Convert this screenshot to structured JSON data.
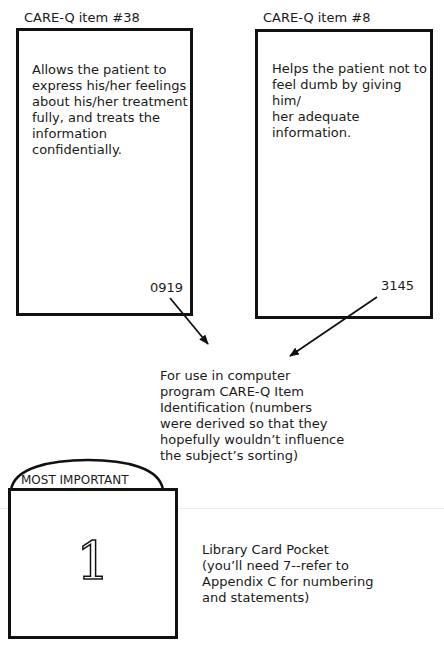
{
  "cards": [
    {
      "label": "CARE-Q item #38",
      "text_lines": [
        "Allows the patient to",
        "express his/her feelings",
        "about his/her treatment",
        "fully, and treats the",
        "information confidentially."
      ],
      "code": "0919"
    },
    {
      "label": "CARE-Q item #8",
      "text_lines": [
        "Helps the patient not to",
        "feel dumb by giving him/",
        "her adequate information."
      ],
      "code": "3145"
    }
  ],
  "code_note": {
    "lines": [
      "For use in computer",
      "program CARE-Q Item",
      "Identification (numbers",
      "were derived so that they",
      "hopefully wouldn’t influence",
      "the subject’s sorting)"
    ]
  },
  "pocket": {
    "tab_label": "MOST IMPORTANT",
    "number": "1"
  },
  "pocket_note": {
    "lines": [
      "Library Card Pocket",
      "(you’ll need 7--refer to",
      "Appendix C for numbering",
      "and statements)"
    ]
  },
  "icons": {
    "arrow_left": "arrow-down-right",
    "arrow_right": "arrow-down-left"
  },
  "colors": {
    "ink": "#111111",
    "background": "#ffffff"
  }
}
